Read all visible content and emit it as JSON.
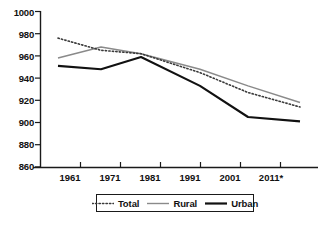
{
  "chart_data": {
    "type": "line",
    "title": "",
    "xlabel": "",
    "ylabel": "",
    "categories": [
      "1961",
      "1971",
      "1981",
      "1991",
      "2001",
      "2011*"
    ],
    "ylim": [
      860,
      1000
    ],
    "yticks": [
      860,
      880,
      900,
      920,
      940,
      960,
      980,
      1000
    ],
    "grid": false,
    "legend_position": "bottom",
    "series": [
      {
        "name": "Total",
        "style": "dotted",
        "color": "#3a3a3a",
        "values": [
          976,
          965,
          962,
          945,
          927,
          914
        ]
      },
      {
        "name": "Rural",
        "style": "solid-thin",
        "color": "#8a8a8a",
        "values": [
          958,
          968,
          962,
          948,
          933,
          918
        ]
      },
      {
        "name": "Urban",
        "style": "solid-thick",
        "color": "#111111",
        "values": [
          951,
          948,
          959,
          933,
          905,
          901
        ]
      }
    ]
  },
  "axis": {
    "y_tick_labels": [
      "1000",
      "980",
      "960",
      "940",
      "920",
      "900",
      "880",
      "860"
    ],
    "x_tick_labels": [
      "1961",
      "1971",
      "1981",
      "1991",
      "2001",
      "2011*"
    ]
  },
  "legend": {
    "items": [
      {
        "label": "Total",
        "icon": "dotted-line-swatch"
      },
      {
        "label": "Rural",
        "icon": "thin-line-swatch"
      },
      {
        "label": "Urban",
        "icon": "thick-line-swatch"
      }
    ]
  },
  "colors": {
    "total": "#3a3a3a",
    "rural": "#8a8a8a",
    "urban": "#111111",
    "axis": "#1a1a1a",
    "background": "#ffffff"
  }
}
